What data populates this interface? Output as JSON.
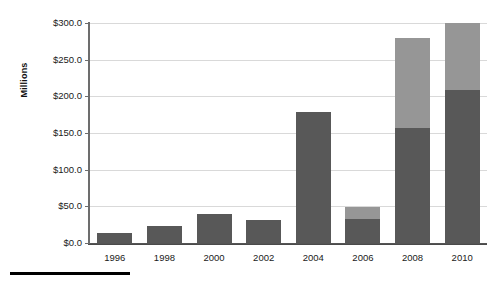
{
  "chart_data": {
    "type": "bar",
    "title": "",
    "subtitle": "",
    "xlabel": "",
    "ylabel": "Millions",
    "ylim": [
      0,
      300
    ],
    "ytick_step": 50,
    "grid": true,
    "stacked": true,
    "legend": "none",
    "categories": [
      "1996",
      "1998",
      "2000",
      "2002",
      "2004",
      "2006",
      "2008",
      "2010"
    ],
    "ytick_labels": [
      "$0.0",
      "$50.0",
      "$100.0",
      "$150.0",
      "$200.0",
      "$250.0",
      "$300.0"
    ],
    "ytick_values": [
      0,
      50,
      100,
      150,
      200,
      250,
      300
    ],
    "series": [
      {
        "name": "lower",
        "color": "#585858",
        "values": [
          14,
          23,
          40,
          31,
          179,
          33,
          157,
          209
        ]
      },
      {
        "name": "upper",
        "color": "#969696",
        "values": [
          0,
          0,
          0,
          0,
          0,
          16,
          123,
          91
        ]
      }
    ],
    "totals": [
      14,
      23,
      40,
      31,
      179,
      49,
      280,
      300
    ]
  },
  "colors": {
    "lower_segment": "#585858",
    "upper_segment": "#969696",
    "gridline": "#d9d9d9",
    "axis": "#6d6d6d",
    "text": "#1a1a1a",
    "footer_rule": "#000000"
  }
}
